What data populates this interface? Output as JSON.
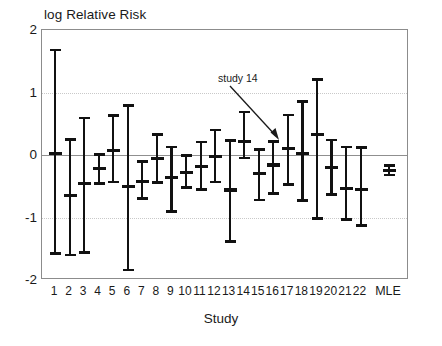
{
  "chart_data": {
    "type": "scatter",
    "title": "",
    "ylabel": "log Relative Risk",
    "xlabel": "Study",
    "ylim": [
      -2,
      2
    ],
    "yticks": [
      2,
      1,
      0,
      -1,
      -2
    ],
    "grid": "dotted horizontal gridlines at 1 and -1, solid line at 0",
    "legend": "none",
    "categories": [
      "1",
      "2",
      "3",
      "4",
      "5",
      "6",
      "7",
      "8",
      "9",
      "10",
      "11",
      "12",
      "13",
      "14",
      "15",
      "16",
      "17",
      "18",
      "19",
      "20",
      "21",
      "22",
      "MLE"
    ],
    "annotations": [
      {
        "text": "study 14",
        "points_to": "14"
      }
    ],
    "series": [
      {
        "name": "log Relative Risk with 95% confidence interval",
        "points": [
          {
            "category": "1",
            "estimate": 0.03,
            "lower": -1.58,
            "upper": 1.68
          },
          {
            "category": "2",
            "estimate": -0.65,
            "lower": -1.6,
            "upper": 0.25
          },
          {
            "category": "3",
            "estimate": -0.45,
            "lower": -1.56,
            "upper": 0.59
          },
          {
            "category": "4",
            "estimate": -0.22,
            "lower": -0.46,
            "upper": 0.01
          },
          {
            "category": "5",
            "estimate": 0.07,
            "lower": -0.43,
            "upper": 0.63
          },
          {
            "category": "6",
            "estimate": -0.5,
            "lower": -1.84,
            "upper": 0.79
          },
          {
            "category": "7",
            "estimate": -0.42,
            "lower": -0.7,
            "upper": -0.1
          },
          {
            "category": "8",
            "estimate": -0.06,
            "lower": -0.44,
            "upper": 0.33
          },
          {
            "category": "9",
            "estimate": -0.36,
            "lower": -0.9,
            "upper": 0.13
          },
          {
            "category": "10",
            "estimate": -0.28,
            "lower": -0.52,
            "upper": -0.01
          },
          {
            "category": "11",
            "estimate": -0.19,
            "lower": -0.55,
            "upper": 0.21
          },
          {
            "category": "12",
            "estimate": -0.03,
            "lower": -0.43,
            "upper": 0.4
          },
          {
            "category": "13",
            "estimate": -0.56,
            "lower": -1.38,
            "upper": 0.23
          },
          {
            "category": "14",
            "estimate": 0.22,
            "lower": -0.05,
            "upper": 0.69
          },
          {
            "category": "15",
            "estimate": -0.3,
            "lower": -0.72,
            "upper": 0.09
          },
          {
            "category": "16",
            "estimate": -0.16,
            "lower": -0.62,
            "upper": 0.22
          },
          {
            "category": "17",
            "estimate": 0.11,
            "lower": -0.47,
            "upper": 0.64
          },
          {
            "category": "18",
            "estimate": 0.02,
            "lower": -0.73,
            "upper": 0.86
          },
          {
            "category": "19",
            "estimate": 0.33,
            "lower": -1.02,
            "upper": 1.21
          },
          {
            "category": "20",
            "estimate": -0.2,
            "lower": -0.63,
            "upper": 0.24
          },
          {
            "category": "21",
            "estimate": -0.53,
            "lower": -1.03,
            "upper": 0.13
          },
          {
            "category": "22",
            "estimate": -0.55,
            "lower": -1.13,
            "upper": 0.12
          },
          {
            "category": "MLE",
            "estimate": -0.25,
            "lower": -0.32,
            "upper": -0.17
          }
        ]
      }
    ]
  },
  "axis": {
    "y_title": "log Relative Risk",
    "x_title": "Study",
    "y_ticks": [
      "2",
      "1",
      "0",
      "-1",
      "-2"
    ],
    "x_ticks": [
      "1",
      "2",
      "3",
      "4",
      "5",
      "6",
      "7",
      "8",
      "9",
      "10",
      "11",
      "12",
      "13",
      "14",
      "15",
      "16",
      "17",
      "18",
      "19",
      "20",
      "21",
      "22",
      "MLE"
    ]
  },
  "annotation": {
    "study14_label": "study 14"
  },
  "colors": {
    "marker": "#111111",
    "frame": "#8c8c8c",
    "gridline": "#c9c9c9",
    "zeroline": "#8f8f8f",
    "background": "#ffffff"
  }
}
